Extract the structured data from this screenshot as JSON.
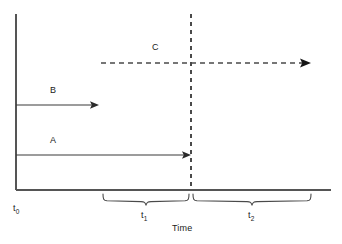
{
  "figure": {
    "type": "timeline-diagram",
    "background_color": "#ffffff",
    "stroke_color": "#3a3a3a",
    "text_color": "#1a1a1a"
  },
  "axes": {
    "y_axis": {
      "name": "vertical-axis",
      "x": 16,
      "y_top": 14,
      "y_bottom": 190
    },
    "x_axis": {
      "name": "horizontal-axis",
      "y": 190,
      "x_left": 16,
      "x_right": 331,
      "label": "Time"
    },
    "origin_label": {
      "base": "t",
      "sub": "0",
      "x": 14,
      "y": 206
    }
  },
  "divider": {
    "name": "event-divider",
    "style": "dashed",
    "x": 191,
    "y_top": 14,
    "y_bottom": 190
  },
  "arrows": [
    {
      "id": "B",
      "label": "B",
      "style": "solid",
      "y": 105,
      "x_start": 16,
      "x_end": 99,
      "label_x": 50,
      "label_y": 88
    },
    {
      "id": "A",
      "label": "A",
      "style": "solid",
      "y": 155,
      "x_start": 16,
      "x_end": 191,
      "label_x": 50,
      "label_y": 138
    },
    {
      "id": "C",
      "label": "C",
      "style": "dashed",
      "y": 63,
      "x_start": 101,
      "x_end": 311,
      "label_x": 152,
      "label_y": 45
    }
  ],
  "intervals": [
    {
      "id": "t1",
      "base": "t",
      "sub": "1",
      "brace_x_start": 103,
      "brace_x_end": 189,
      "brace_y": 194,
      "label_x": 141,
      "label_y": 213
    },
    {
      "id": "t2",
      "base": "t",
      "sub": "2",
      "brace_x_start": 193,
      "brace_x_end": 311,
      "brace_y": 194,
      "label_x": 248,
      "label_y": 213
    }
  ],
  "axis_caption": {
    "text": "Time",
    "x": 186,
    "y": 226
  }
}
